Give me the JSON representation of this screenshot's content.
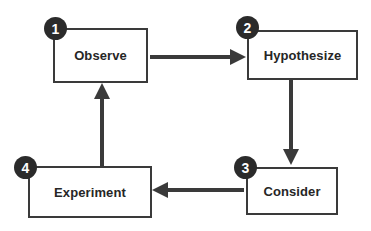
{
  "diagram": {
    "type": "cycle-flowchart",
    "colors": {
      "background": "#ffffff",
      "box_border": "#3a3a3a",
      "box_fill": "#ffffff",
      "text": "#262626",
      "badge_fill": "#2b2b2b",
      "badge_text": "#ffffff",
      "arrow": "#3a3a3a"
    },
    "nodes": [
      {
        "id": "observe",
        "number": "1",
        "label": "Observe"
      },
      {
        "id": "hypothesize",
        "number": "2",
        "label": "Hypothesize"
      },
      {
        "id": "consider",
        "number": "3",
        "label": "Consider"
      },
      {
        "id": "experiment",
        "number": "4",
        "label": "Experiment"
      }
    ],
    "edges": [
      {
        "id": "observe-to-hypothesize",
        "from": "observe",
        "to": "hypothesize",
        "direction": "right"
      },
      {
        "id": "hypothesize-to-consider",
        "from": "hypothesize",
        "to": "consider",
        "direction": "down"
      },
      {
        "id": "consider-to-experiment",
        "from": "consider",
        "to": "experiment",
        "direction": "left"
      },
      {
        "id": "experiment-to-observe",
        "from": "experiment",
        "to": "observe",
        "direction": "up"
      }
    ]
  }
}
